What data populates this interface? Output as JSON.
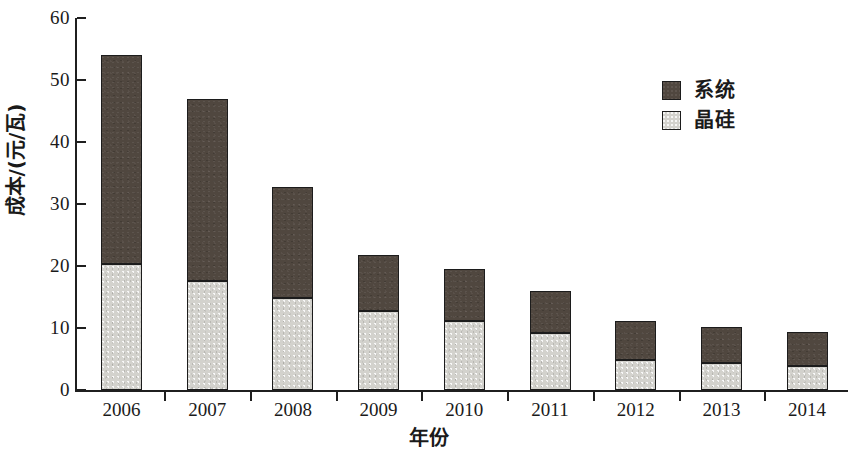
{
  "chart_data": {
    "type": "bar",
    "stacked": true,
    "title": "",
    "xlabel": "年份",
    "ylabel": "成本/(元/瓦)",
    "categories": [
      "2006",
      "2007",
      "2008",
      "2009",
      "2010",
      "2011",
      "2012",
      "2013",
      "2014"
    ],
    "series": [
      {
        "name": "晶硅",
        "color": "#d3d2cd",
        "values": [
          20.3,
          17.6,
          14.8,
          12.7,
          11.1,
          9.2,
          4.8,
          4.4,
          3.8
        ]
      },
      {
        "name": "系统",
        "color": "#50473f",
        "values": [
          33.7,
          29.4,
          18.0,
          9.1,
          8.4,
          6.8,
          6.4,
          5.8,
          5.6
        ]
      }
    ],
    "totals": [
      54.0,
      47.0,
      32.8,
      21.8,
      19.5,
      16.0,
      11.2,
      10.2,
      9.4
    ],
    "ylim": [
      0,
      60
    ],
    "yticks": [
      0,
      10,
      20,
      30,
      40,
      50,
      60
    ],
    "ytick_labels": [
      "0",
      "10",
      "20",
      "30",
      "40",
      "50",
      "60"
    ],
    "grid": false,
    "legend_position": "top-right",
    "legend_entries": [
      "系统",
      "晶硅"
    ]
  },
  "axes": {
    "y_title": "成本/(元/瓦)",
    "x_title": "年份"
  },
  "legend": {
    "items": [
      {
        "label": "系统",
        "color": "#50473f"
      },
      {
        "label": "晶硅",
        "color": "#d3d2cd"
      }
    ]
  }
}
